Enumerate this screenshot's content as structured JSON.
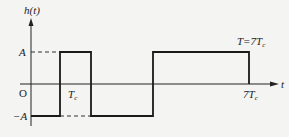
{
  "diagram": {
    "y_axis_label": "h(t)",
    "x_axis_label": "t",
    "origin_label": "O",
    "level_high_label": "A",
    "level_low_label": "−A",
    "pulse_width_label": {
      "main": "T",
      "sub": "c"
    },
    "end_time_label": {
      "main": "7T",
      "sub": "c"
    },
    "period_label": {
      "prefix": "T=7T",
      "sub": "c"
    },
    "signal": {
      "description": "pseudo-random binary waveform (rectangular pulses)",
      "segments": [
        {
          "t_start_Tc": 0,
          "t_end_Tc": 1,
          "level": "-A"
        },
        {
          "t_start_Tc": 1,
          "t_end_Tc": 2,
          "level": "A"
        },
        {
          "t_start_Tc": 2,
          "t_end_Tc": 4,
          "level": "-A"
        },
        {
          "t_start_Tc": 4,
          "t_end_Tc": 7,
          "level": "A"
        }
      ]
    },
    "colors": {
      "line": "#1a1a1a",
      "background": "#f4f4f2"
    }
  }
}
